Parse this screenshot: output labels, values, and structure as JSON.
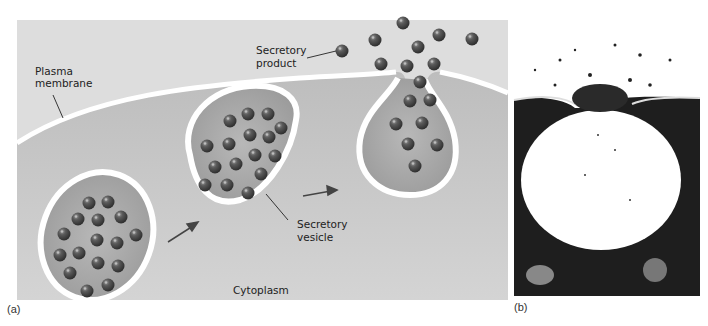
{
  "figure": {
    "panel_a": {
      "letter": "(a)",
      "labels": {
        "plasma_membrane_1": "Plasma",
        "plasma_membrane_2": "membrane",
        "secretory_product_1": "Secretory",
        "secretory_product_2": "product",
        "secretory_vesicle_1": "Secretory",
        "secretory_vesicle_2": "vesicle",
        "cytoplasm": "Cytoplasm"
      }
    },
    "panel_b": {
      "letter": "(b)",
      "description": "Electron micrograph of exocytosis"
    }
  },
  "colors": {
    "extracellular": "#dcdcdc",
    "cytoplasm": "#c9c9c9",
    "membrane": "#ffffff",
    "vesicle_interior": "#a9a9a9",
    "granule": "#4a4a4a",
    "arrow": "#444444"
  }
}
